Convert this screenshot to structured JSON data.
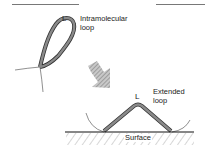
{
  "diagram": {
    "loop_top": {
      "letter": "L",
      "label_line1": "Intramolecular",
      "label_line2": "loop"
    },
    "loop_bottom": {
      "letter": "L",
      "label_line1": "Extended",
      "label_line2": "loop"
    },
    "surface": {
      "label": "Surface"
    },
    "arrow": {
      "direction": "down-right",
      "style": "hatched"
    },
    "colors": {
      "strand_fill": "#8a8a8a",
      "strand_outline": "#333333",
      "line": "#222222",
      "arrow_fill": "#9a9a9a"
    }
  }
}
